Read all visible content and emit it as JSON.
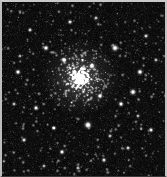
{
  "image": {
    "kind": "astronomical-image",
    "subject": "globular-star-cluster",
    "width": 167,
    "height": 177,
    "background_color": "#050505",
    "star_color": "#ffffff",
    "border_color": "#c9c9c9",
    "border_width_px": 2,
    "alt_text": "Dense globular star cluster centered slightly above image center, surrounded by a rich field of foreground and background stars on a black sky."
  },
  "chart_data": {
    "type": "scatter",
    "title": "",
    "xlabel": "",
    "ylabel": "",
    "xlim": [
      0,
      167
    ],
    "ylim": [
      0,
      177
    ],
    "grid": false,
    "legend": "none",
    "background": "#050505",
    "point_color": "#ffffff",
    "cluster": {
      "name": "globular-cluster-core",
      "center_x": 80,
      "center_y": 78,
      "core_radius": 16,
      "halo_radius": 34,
      "member_count": 520,
      "peak_brightness": 1.0
    },
    "bright_stars": [
      {
        "x": 88,
        "y": 125,
        "b": 1.0,
        "r": 3.4
      },
      {
        "x": 115,
        "y": 48,
        "b": 0.96,
        "r": 3.2
      },
      {
        "x": 133,
        "y": 92,
        "b": 0.92,
        "r": 3.0
      },
      {
        "x": 140,
        "y": 72,
        "b": 0.88,
        "r": 2.8
      },
      {
        "x": 46,
        "y": 48,
        "b": 0.86,
        "r": 2.7
      },
      {
        "x": 18,
        "y": 72,
        "b": 0.84,
        "r": 2.6
      },
      {
        "x": 121,
        "y": 104,
        "b": 0.82,
        "r": 2.6
      },
      {
        "x": 36,
        "y": 108,
        "b": 0.8,
        "r": 2.5
      },
      {
        "x": 151,
        "y": 130,
        "b": 0.78,
        "r": 2.4
      },
      {
        "x": 62,
        "y": 152,
        "b": 0.8,
        "r": 2.5
      },
      {
        "x": 104,
        "y": 160,
        "b": 0.76,
        "r": 2.3
      },
      {
        "x": 24,
        "y": 140,
        "b": 0.74,
        "r": 2.3
      },
      {
        "x": 146,
        "y": 36,
        "b": 0.72,
        "r": 2.2
      },
      {
        "x": 70,
        "y": 22,
        "b": 0.74,
        "r": 2.3
      },
      {
        "x": 30,
        "y": 30,
        "b": 0.7,
        "r": 2.2
      },
      {
        "x": 128,
        "y": 148,
        "b": 0.7,
        "r": 2.2
      },
      {
        "x": 96,
        "y": 18,
        "b": 0.68,
        "r": 2.1
      },
      {
        "x": 54,
        "y": 128,
        "b": 0.72,
        "r": 2.2
      },
      {
        "x": 14,
        "y": 104,
        "b": 0.66,
        "r": 2.1
      },
      {
        "x": 156,
        "y": 60,
        "b": 0.64,
        "r": 2.0
      },
      {
        "x": 110,
        "y": 136,
        "b": 0.66,
        "r": 2.1
      },
      {
        "x": 44,
        "y": 166,
        "b": 0.62,
        "r": 2.0
      },
      {
        "x": 78,
        "y": 168,
        "b": 0.64,
        "r": 2.0
      },
      {
        "x": 138,
        "y": 116,
        "b": 0.62,
        "r": 2.0
      },
      {
        "x": 20,
        "y": 56,
        "b": 0.6,
        "r": 1.9
      },
      {
        "x": 100,
        "y": 96,
        "b": 0.88,
        "r": 2.6
      },
      {
        "x": 64,
        "y": 60,
        "b": 0.9,
        "r": 2.7
      },
      {
        "x": 92,
        "y": 66,
        "b": 0.94,
        "r": 2.8
      }
    ],
    "field_star_count": 900,
    "field_brightness_range": [
      0.06,
      0.55
    ]
  }
}
